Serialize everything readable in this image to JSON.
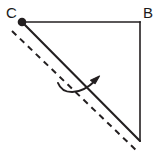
{
  "figure": {
    "type": "geometry-diagram",
    "background_color": "#ffffff",
    "stroke_color": "#231f20",
    "labels": [
      {
        "id": "C",
        "text": "C",
        "x": 6,
        "y": 5
      },
      {
        "id": "B",
        "text": "B",
        "x": 143,
        "y": 5
      }
    ],
    "vertices": {
      "C": {
        "x": 22,
        "y": 22,
        "marked": true,
        "marker": "filled-dot",
        "marker_radius": 4.2
      },
      "B": {
        "x": 140,
        "y": 22,
        "marked": false
      },
      "A": {
        "x": 140,
        "y": 141,
        "marked": false
      }
    },
    "segments": [
      {
        "name": "top-side-CB",
        "from": "C",
        "to": "B",
        "style": "solid",
        "width": 1.6
      },
      {
        "name": "right-side-BA",
        "from": "B",
        "to": "A",
        "style": "solid",
        "width": 1.6
      },
      {
        "name": "hypotenuse-CA",
        "from": "C",
        "to": "A",
        "style": "solid",
        "width": 2.0
      }
    ],
    "dashed_line": {
      "name": "dashed-parallel-line",
      "x1": 12,
      "y1": 31,
      "x2": 138,
      "y2": 152,
      "style": "dashed",
      "dash_pattern": "6 5",
      "width": 2.0
    },
    "curved_arrow": {
      "name": "rotation-arrow",
      "path": "M 58 83 C 63 94, 78 96, 97 79",
      "tip_x": 97,
      "tip_y": 79,
      "width": 2.0,
      "direction": "up-right"
    }
  }
}
